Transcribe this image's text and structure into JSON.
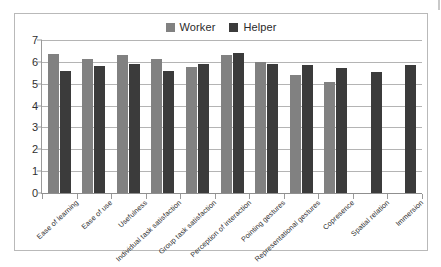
{
  "chart_data": {
    "type": "bar",
    "title": "",
    "subtitle": "",
    "xlabel": "",
    "ylabel": "",
    "ylim": [
      0,
      7
    ],
    "y_ticks": [
      "0",
      "1",
      "2",
      "3",
      "4",
      "5",
      "6",
      "7"
    ],
    "grid": true,
    "legend_position": "top-center",
    "categories": [
      "Ease of learning",
      "Ease of use",
      "Usefulness",
      "Individual task satisfaction",
      "Group task satisfaction",
      "Perception of interaction",
      "Pointing gestures",
      "Representational gestures",
      "Copresence",
      "Spatial relation",
      "Immersion"
    ],
    "series": [
      {
        "name": "Worker",
        "color": "#818181",
        "values": [
          6.35,
          6.15,
          6.3,
          6.15,
          5.75,
          6.3,
          6.0,
          5.4,
          5.07,
          null,
          null
        ]
      },
      {
        "name": "Helper",
        "color": "#3b3b3b",
        "values": [
          5.6,
          5.8,
          5.9,
          5.6,
          5.9,
          6.4,
          5.9,
          5.85,
          5.7,
          5.55,
          5.85
        ]
      }
    ]
  },
  "legend": {
    "items": [
      {
        "label": "Worker",
        "color": "#818181"
      },
      {
        "label": "Helper",
        "color": "#3b3b3b"
      }
    ]
  }
}
